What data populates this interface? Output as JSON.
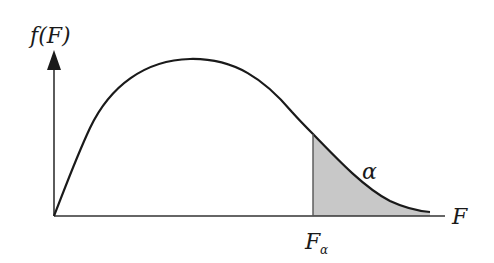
{
  "diagram": {
    "y_axis_label": "f(F)",
    "x_axis_label": "F",
    "critical_value_label": "F",
    "critical_value_subscript": "α",
    "tail_area_label": "α",
    "colors": {
      "curve": "#1a1a1a",
      "axes": "#333333",
      "tail_fill": "#c8c8c8",
      "background": "#ffffff"
    }
  }
}
